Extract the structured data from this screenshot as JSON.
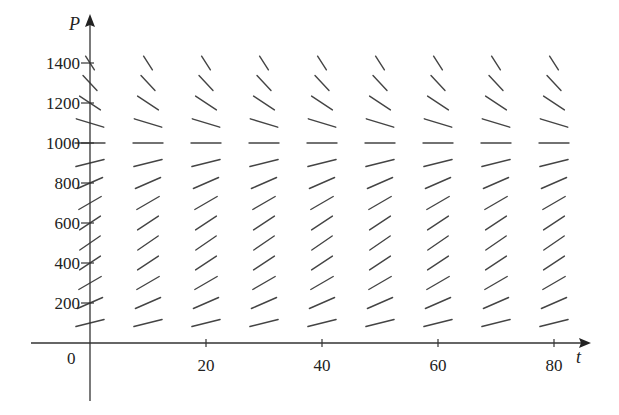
{
  "chart_data": {
    "type": "slope_field",
    "title": "",
    "equation_model": "dP/dt = k P (1 - P / M)",
    "parameters": {
      "k": 0.08,
      "M": 1000
    },
    "xlabel": "t",
    "ylabel": "P",
    "xlim": [
      -10,
      87
    ],
    "ylim": [
      -290,
      1640
    ],
    "x_ticks": [
      {
        "value": 0,
        "label": "0"
      },
      {
        "value": 20,
        "label": "20"
      },
      {
        "value": 40,
        "label": "40"
      },
      {
        "value": 60,
        "label": "60"
      },
      {
        "value": 80,
        "label": "80"
      }
    ],
    "y_ticks": [
      {
        "value": 200,
        "label": "200"
      },
      {
        "value": 400,
        "label": "400"
      },
      {
        "value": 600,
        "label": "600"
      },
      {
        "value": 800,
        "label": "800"
      },
      {
        "value": 1000,
        "label": "1000"
      },
      {
        "value": 1200,
        "label": "1200"
      },
      {
        "value": 1400,
        "label": "1400"
      }
    ],
    "grid_t": [
      0,
      10,
      20,
      30,
      40,
      50,
      60,
      70,
      80
    ],
    "grid_P": [
      100,
      200,
      300,
      400,
      500,
      600,
      700,
      800,
      900,
      1000,
      1100,
      1200,
      1300,
      1400
    ],
    "grid": false,
    "legend": null,
    "equilibrium": 1000
  },
  "layout": {
    "origin_px": [
      90,
      343
    ],
    "px_per_t": 5.8,
    "px_per_P": 0.2,
    "x_axis_px": [
      31,
      590
    ],
    "y_axis_px": [
      15,
      401
    ],
    "segment_base_len": 30
  }
}
